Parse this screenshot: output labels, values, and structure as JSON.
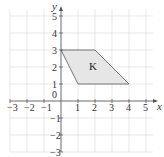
{
  "diagram": {
    "x_axis_label": "x",
    "y_axis_label": "y",
    "x_ticks": [
      "−3",
      "−2",
      "−1",
      "0",
      "1",
      "2",
      "3",
      "4",
      "5"
    ],
    "y_ticks_pos": [
      "1",
      "2",
      "3",
      "4",
      "5"
    ],
    "y_ticks_neg": [
      "−1",
      "−2",
      "−3"
    ],
    "shape": {
      "label": "K",
      "vertices": [
        [
          0,
          3
        ],
        [
          2,
          3
        ],
        [
          4,
          1
        ],
        [
          1,
          1
        ]
      ],
      "fill": "#e6e6e6",
      "stroke": "#555555"
    },
    "grid_color": "#d9d9d9",
    "axis_color": "#555555"
  }
}
